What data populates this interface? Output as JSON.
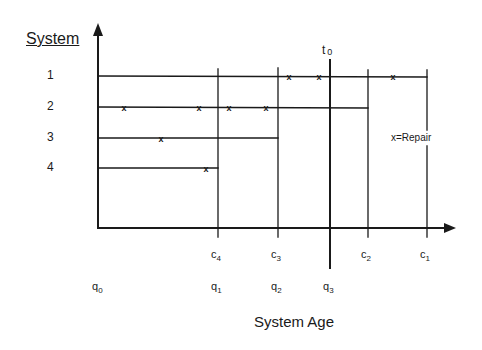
{
  "y_axis": {
    "label": "System"
  },
  "x_axis": {
    "label": "System Age"
  },
  "systems": [
    {
      "id": "1",
      "label": "1",
      "end": "c1",
      "repairs": 3
    },
    {
      "id": "2",
      "label": "2",
      "end": "c2",
      "repairs": 4
    },
    {
      "id": "3",
      "label": "3",
      "end": "c3",
      "repairs": 1
    },
    {
      "id": "4",
      "label": "4",
      "end": "c4",
      "repairs": 1
    }
  ],
  "censoring_ticks": [
    {
      "base": "c",
      "sub": "4"
    },
    {
      "base": "c",
      "sub": "3"
    },
    {
      "base": "c",
      "sub": "2"
    },
    {
      "base": "c",
      "sub": "1"
    }
  ],
  "quantile_ticks": [
    {
      "base": "q",
      "sub": "0"
    },
    {
      "base": "q",
      "sub": "1"
    },
    {
      "base": "q",
      "sub": "2"
    },
    {
      "base": "q",
      "sub": "3"
    }
  ],
  "current_time": {
    "base": "t",
    "sub": "0"
  },
  "legend": {
    "text": "x=Repair"
  },
  "colors": {
    "line": "#1a1a1a",
    "background": "#ffffff"
  }
}
